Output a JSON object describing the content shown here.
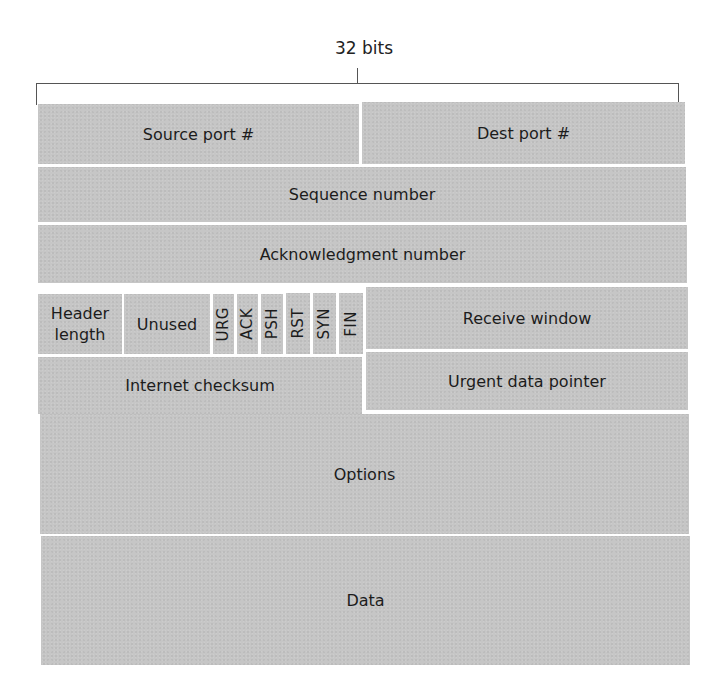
{
  "diagram": {
    "width_label": "32 bits",
    "fill_color": "#c6c6c6",
    "separator_color": "#ffffff",
    "rows": [
      {
        "fields": [
          {
            "id": "source_port",
            "label": "Source port #"
          },
          {
            "id": "dest_port",
            "label": "Dest port #"
          }
        ]
      },
      {
        "fields": [
          {
            "id": "sequence_number",
            "label": "Sequence number"
          }
        ]
      },
      {
        "fields": [
          {
            "id": "ack_number",
            "label": "Acknowledgment number"
          }
        ]
      },
      {
        "fields": [
          {
            "id": "header_length",
            "label_line1": "Header",
            "label_line2": "length"
          },
          {
            "id": "unused",
            "label": "Unused"
          },
          {
            "id": "urg",
            "label": "URG"
          },
          {
            "id": "ack",
            "label": "ACK"
          },
          {
            "id": "psh",
            "label": "PSH"
          },
          {
            "id": "rst",
            "label": "RST"
          },
          {
            "id": "syn",
            "label": "SYN"
          },
          {
            "id": "fin",
            "label": "FIN"
          },
          {
            "id": "receive_window",
            "label": "Receive window"
          }
        ]
      },
      {
        "fields": [
          {
            "id": "internet_checksum",
            "label": "Internet checksum"
          },
          {
            "id": "urgent_pointer",
            "label": "Urgent data pointer"
          }
        ]
      },
      {
        "fields": [
          {
            "id": "options",
            "label": "Options"
          }
        ]
      },
      {
        "fields": [
          {
            "id": "data",
            "label": "Data"
          }
        ]
      }
    ]
  }
}
